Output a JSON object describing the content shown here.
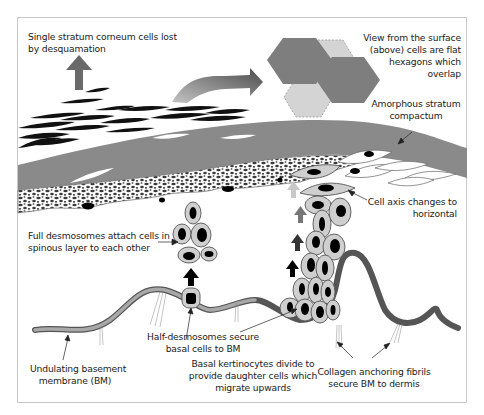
{
  "diagram": {
    "colors": {
      "frame_border": "#c8c8c8",
      "stratum_compactum": "#8a8a8a",
      "basement_membrane_fill": "#9a9a9a",
      "basement_membrane_dark": "#4a4a4a",
      "cell_fill": "#cfcfcf",
      "cell_outline": "#555555",
      "nucleus": "#0a0a0a",
      "hexagon_dark": "#7a7a7a",
      "hexagon_light": "#cfcfcf",
      "text": "#222222"
    },
    "labels": {
      "desquamation": [
        "Single stratum corneum cells lost",
        "by desquamation"
      ],
      "surface_view": [
        "View from the surface",
        "(above) cells are flat",
        "hexagons which",
        "overlap"
      ],
      "stratum_compactum": [
        "Amorphous stratum",
        "compactum"
      ],
      "full_desmosomes": [
        "Full desmosomes attach cells in",
        "spinous layer to each other"
      ],
      "cell_axis": [
        "Cell axis changes to",
        "horizontal"
      ],
      "half_desmosomes": [
        "Half-desmosomes secure",
        "basal cells to BM"
      ],
      "basal_keratinocytes": [
        "Basal kertinocytes divide to",
        "provide daughter cells which",
        "migrate upwards"
      ],
      "basement_membrane": [
        "Undulating basement",
        "membrane (BM)"
      ],
      "collagen_fibrils": [
        "Collagen anchoring fibrils",
        "secure BM to dermis"
      ]
    },
    "structures": [
      {
        "name": "stratum-corneum-flakes",
        "shape": "black lenticular cells"
      },
      {
        "name": "stratum-compactum",
        "shape": "grey band"
      },
      {
        "name": "granular-layer",
        "shape": "speckled band"
      },
      {
        "name": "spinous-cluster",
        "cells": 5
      },
      {
        "name": "basal-cell",
        "cells": 1
      },
      {
        "name": "migrating-column",
        "cells": 16
      },
      {
        "name": "surface-hexagons",
        "count": 4
      },
      {
        "name": "basement-membrane",
        "shape": "undulating line"
      }
    ]
  }
}
